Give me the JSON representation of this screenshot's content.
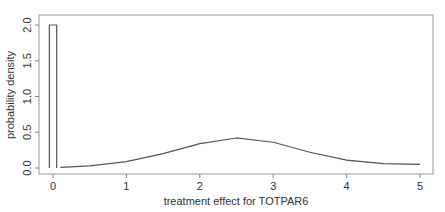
{
  "chart_data": {
    "type": "line",
    "title": "",
    "xlabel": "treatment effect for TOTPAR6",
    "ylabel": "probability density",
    "xlim": [
      -0.2,
      5.2
    ],
    "ylim": [
      0.0,
      2.05
    ],
    "x_ticks": [
      0,
      1,
      2,
      3,
      4,
      5
    ],
    "x_tick_labels": [
      "0",
      "1",
      "2",
      "3",
      "4",
      "5"
    ],
    "y_ticks": [
      0.0,
      0.5,
      1.0,
      1.5,
      2.0
    ],
    "y_tick_labels": [
      "0.0",
      "0.5",
      "1.0",
      "1.5",
      "2.0"
    ],
    "grid": false,
    "legend": null,
    "series": [
      {
        "name": "point mass at zero",
        "kind": "rectangle",
        "x": [
          -0.05,
          -0.05,
          0.05,
          0.05
        ],
        "y": [
          0.0,
          2.0,
          2.0,
          0.0
        ]
      },
      {
        "name": "density curve",
        "kind": "line",
        "x": [
          0.1,
          0.5,
          1.0,
          1.5,
          2.0,
          2.5,
          3.0,
          3.5,
          4.0,
          4.5,
          5.0
        ],
        "y": [
          0.01,
          0.03,
          0.09,
          0.2,
          0.34,
          0.42,
          0.36,
          0.22,
          0.11,
          0.06,
          0.05
        ]
      }
    ]
  },
  "colors": {
    "line": "#555555",
    "axis": "#888888",
    "text": "#333333"
  }
}
